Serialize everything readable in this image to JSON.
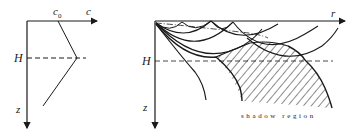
{
  "left_panel": {
    "axis_x_label": "c",
    "axis_z_label": "z",
    "c0_label": "c",
    "c0_subscript": "0",
    "depth_label": "H"
  },
  "right_panel": {
    "axis_x_label": "r",
    "axis_z_label": "z",
    "depth_label": "H",
    "shadow_caption": "shadow region"
  },
  "colors": {
    "stroke": "#1a1a1a",
    "background": "#ffffff"
  }
}
